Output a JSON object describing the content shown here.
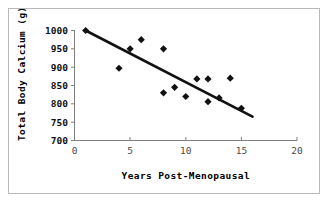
{
  "chart_data": {
    "type": "scatter",
    "title": "",
    "xlabel": "Years Post-Menopausal",
    "ylabel": "Total Body Calcium  (g)",
    "xlim": [
      0,
      20
    ],
    "ylim": [
      700,
      1000
    ],
    "xticks": [
      0,
      5,
      10,
      15,
      20
    ],
    "yticks": [
      700,
      750,
      800,
      850,
      900,
      950,
      1000
    ],
    "xtick_labels": [
      "0",
      "5",
      "10",
      "15",
      "20"
    ],
    "ytick_labels": [
      "700",
      "750",
      "800",
      "850",
      "900",
      "950",
      "1000"
    ],
    "grid": false,
    "legend": "none",
    "marker": "diamond",
    "marker_color": "#111111",
    "x": [
      1,
      4,
      5,
      6,
      8,
      8,
      9,
      10,
      11,
      12,
      12,
      13,
      14,
      15
    ],
    "y": [
      1000,
      897,
      950,
      975,
      950,
      830,
      845,
      820,
      868,
      868,
      806,
      816,
      870,
      788
    ],
    "points": [
      {
        "x": 1,
        "y": 1000
      },
      {
        "x": 4,
        "y": 897
      },
      {
        "x": 5,
        "y": 950
      },
      {
        "x": 6,
        "y": 975
      },
      {
        "x": 8,
        "y": 950
      },
      {
        "x": 8,
        "y": 830
      },
      {
        "x": 9,
        "y": 845
      },
      {
        "x": 10,
        "y": 820
      },
      {
        "x": 11,
        "y": 868
      },
      {
        "x": 12,
        "y": 868
      },
      {
        "x": 12,
        "y": 806
      },
      {
        "x": 13,
        "y": 816
      },
      {
        "x": 14,
        "y": 870
      },
      {
        "x": 15,
        "y": 788
      }
    ],
    "trend_line": {
      "type": "linear",
      "x_start": 1,
      "y_start": 1000,
      "x_end": 16,
      "y_end": 765
    }
  }
}
